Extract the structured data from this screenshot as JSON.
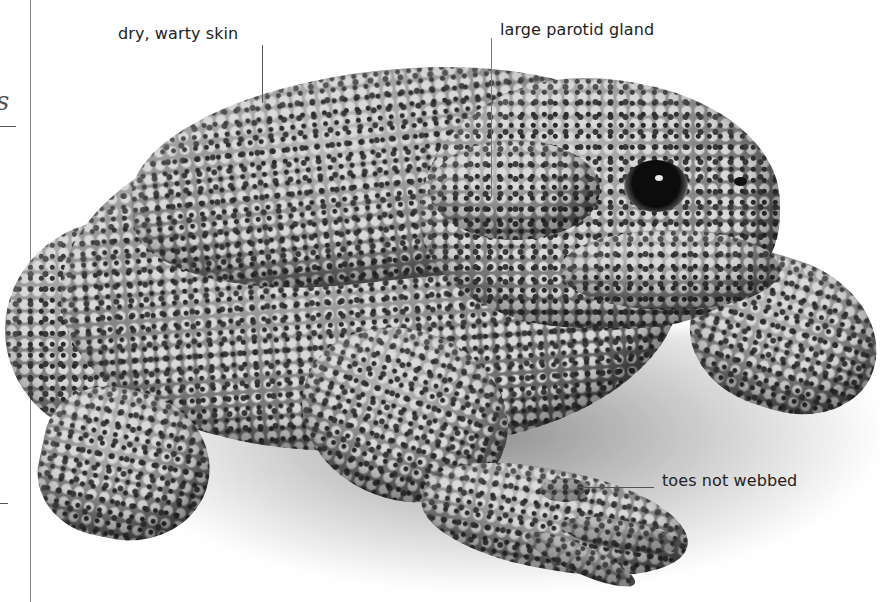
{
  "image": {
    "subject": "toad",
    "style": "greyscale cut-out photograph with annotations",
    "background_color": "#ffffff"
  },
  "margin": {
    "glyph": "s"
  },
  "annotations": [
    {
      "id": "skin",
      "label": "dry, warty skin"
    },
    {
      "id": "gland",
      "label": "large parotid gland"
    },
    {
      "id": "toes",
      "label": "toes not webbed"
    }
  ]
}
